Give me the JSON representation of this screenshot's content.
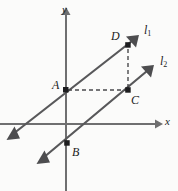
{
  "figure": {
    "background_color": "#fbfbfa",
    "axis_color": "#6f6f70",
    "line_color": "#58585a",
    "dash_color": "#4a4a4c",
    "point_color": "#1d1d1f",
    "width": 178,
    "height": 191
  },
  "axes": {
    "x_label": "x",
    "y_label": "y",
    "origin": {
      "x": 66,
      "y": 124
    }
  },
  "lines": [
    {
      "id": "l1",
      "label": "l",
      "subscript": "1",
      "through": [
        "A",
        "D"
      ],
      "start": {
        "x": 8,
        "y": 138
      },
      "end": {
        "x": 137,
        "y": 37
      },
      "double_arrow": true
    },
    {
      "id": "l2",
      "label": "l",
      "subscript": "2",
      "through": [
        "B",
        "C"
      ],
      "start": {
        "x": 38,
        "y": 162
      },
      "end": {
        "x": 152,
        "y": 67
      },
      "double_arrow": true
    }
  ],
  "points": [
    {
      "name": "A",
      "label": "A",
      "x": 66,
      "y": 90,
      "label_x": 52,
      "label_y": 79
    },
    {
      "name": "B",
      "label": "B",
      "x": 67,
      "y": 143,
      "label_x": 72,
      "label_y": 146
    },
    {
      "name": "C",
      "label": "C",
      "x": 128,
      "y": 90,
      "label_x": 131,
      "label_y": 94
    },
    {
      "name": "D",
      "label": "D",
      "x": 128,
      "y": 45,
      "label_x": 111,
      "label_y": 30
    }
  ],
  "dashed_segments": [
    {
      "name": "A-to-C",
      "from": "A",
      "to": "C",
      "x1": 68,
      "y1": 90,
      "x2": 126,
      "y2": 90
    },
    {
      "name": "C-to-D",
      "from": "C",
      "to": "D",
      "x1": 128,
      "y1": 88,
      "x2": 128,
      "y2": 47
    }
  ]
}
